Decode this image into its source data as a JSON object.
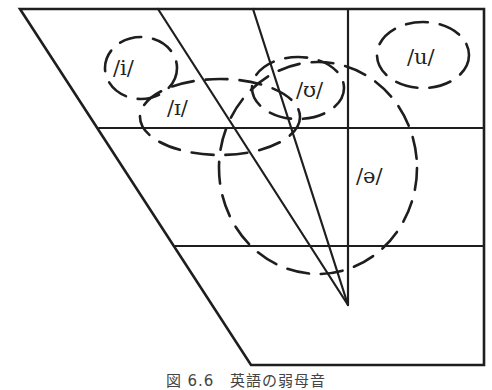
{
  "diagram": {
    "caption": "図 6.6　英語の弱母音",
    "vowels": [
      {
        "id": "i",
        "label": "/i/",
        "position": "front-high"
      },
      {
        "id": "I",
        "label": "/ɪ/",
        "position": "front-high, lowered/centralized"
      },
      {
        "id": "U",
        "label": "/ʊ/",
        "position": "back-high, centralized"
      },
      {
        "id": "u",
        "label": "/u/",
        "position": "back-high"
      },
      {
        "id": "schwa",
        "label": "/ə/",
        "position": "central"
      }
    ],
    "colors": {
      "line": "#1e1e1e",
      "background": "#ffffff",
      "text": "#222222"
    }
  }
}
